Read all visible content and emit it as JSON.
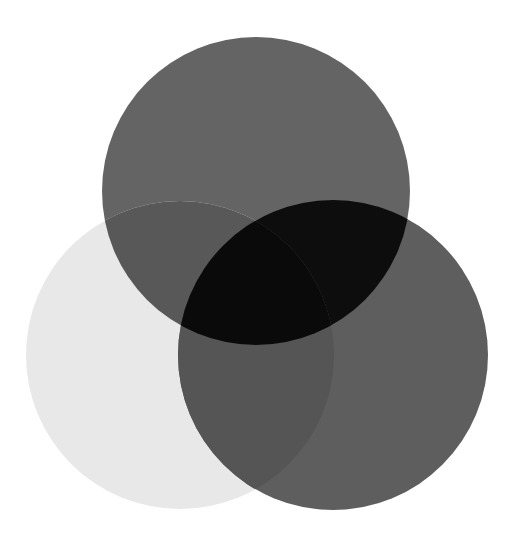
{
  "figure": {
    "kind": "venn-3",
    "background_color": "#FFFFFF",
    "canvas": {
      "width": 512,
      "height": 547
    }
  },
  "chart_data": {
    "type": "venn",
    "subtitle": "",
    "xlabel": "",
    "ylabel": "",
    "grid": false,
    "legend_position": "none",
    "background_color": "#FFFFFF",
    "blend_mode": "multiply",
    "sets": [
      {
        "id": "A",
        "name": "top",
        "label": "",
        "cx": 256,
        "cy": 191,
        "r": 154,
        "fill": "#646464",
        "opacity": 1.0
      },
      {
        "id": "B",
        "name": "left",
        "label": "",
        "cx": 180,
        "cy": 355,
        "r": 154,
        "fill": "#E8E8E8",
        "opacity": 1.0
      },
      {
        "id": "C",
        "name": "right",
        "label": "",
        "cx": 333,
        "cy": 355,
        "r": 155,
        "fill": "#5E5E5E",
        "opacity": 1.0
      }
    ],
    "regions": [
      {
        "id": "A",
        "sets": [
          "top"
        ],
        "fill": "#646464"
      },
      {
        "id": "B",
        "sets": [
          "left"
        ],
        "fill": "#E8E8E8"
      },
      {
        "id": "C",
        "sets": [
          "right"
        ],
        "fill": "#5E5E5E"
      },
      {
        "id": "AB",
        "sets": [
          "top",
          "left"
        ],
        "fill": "#585858"
      },
      {
        "id": "AC",
        "sets": [
          "top",
          "right"
        ],
        "fill": "#0D0D0D"
      },
      {
        "id": "BC",
        "sets": [
          "left",
          "right"
        ],
        "fill": "#555555"
      },
      {
        "id": "ABC",
        "sets": [
          "top",
          "left",
          "right"
        ],
        "fill": "#0A0A0A"
      }
    ],
    "categories": [
      "top",
      "left",
      "right"
    ],
    "values": [
      1,
      1,
      1
    ]
  }
}
